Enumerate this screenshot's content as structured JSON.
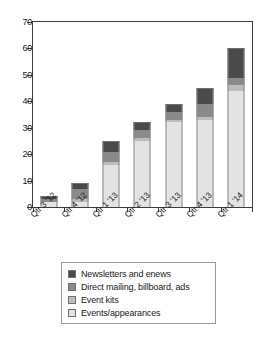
{
  "chart_data": {
    "type": "bar",
    "subtype": "stacked-vertical",
    "title": "",
    "subtitle": "",
    "xlabel": "",
    "ylabel": "",
    "ylim": [
      0,
      70
    ],
    "yticks": [
      0,
      10,
      20,
      30,
      40,
      50,
      60,
      70
    ],
    "ytick_labels": [
      "0",
      "10",
      "20",
      "30",
      "40",
      "50",
      "60",
      "70"
    ],
    "grid": false,
    "legend_position": "bottom",
    "categories": [
      "Qtr 3 '12",
      "Qtr 4 '12",
      "Qtr 1 '13",
      "Qtr 2 '13",
      "Qtr 3 '13",
      "Qtr 4 '13",
      "Qtr 1 '14"
    ],
    "series": [
      {
        "name": "Events/appearances",
        "color": "#e3e3e3",
        "values": [
          2,
          2,
          16,
          25,
          32,
          33,
          44
        ]
      },
      {
        "name": "Event kits",
        "color": "#bdbdbd",
        "values": [
          0,
          1,
          1,
          1,
          1,
          1,
          2
        ]
      },
      {
        "name": "Direct mailing, billboard, ads",
        "color": "#8a8a8a",
        "values": [
          1,
          4,
          4,
          3,
          3,
          5,
          3
        ]
      },
      {
        "name": "Newsletters and enews",
        "color": "#4a4a4a",
        "values": [
          1,
          2,
          4,
          3,
          3,
          6,
          11
        ]
      }
    ],
    "totals": [
      4,
      9,
      25,
      32,
      39,
      45,
      60
    ]
  },
  "legend": {
    "items": [
      {
        "label": "Newsletters and enews",
        "color": "#4a4a4a"
      },
      {
        "label": "Direct mailing, billboard, ads",
        "color": "#8a8a8a"
      },
      {
        "label": "Event kits",
        "color": "#bdbdbd"
      },
      {
        "label": "Events/appearances",
        "color": "#e3e3e3"
      }
    ]
  },
  "axes": {
    "frame_color": "#3d3d3d",
    "background": "#ffffff"
  }
}
